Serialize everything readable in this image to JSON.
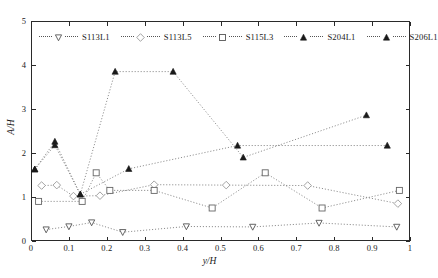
{
  "chart_data": {
    "type": "scatter",
    "title": "",
    "subtitle": "",
    "xlabel": "y/H",
    "ylabel": "A/H",
    "xlim": [
      0,
      1
    ],
    "ylim": [
      0,
      5
    ],
    "xticks": [
      "0",
      "0.1",
      "0.2",
      "0.3",
      "0.4",
      "0.5",
      "0.6",
      "0.7",
      "0.8",
      "0.9",
      "1"
    ],
    "xtick_values": [
      0,
      0.1,
      0.2,
      0.3,
      0.4,
      0.5,
      0.6,
      0.7,
      0.8,
      0.9,
      1
    ],
    "yticks": [
      "0",
      "1",
      "2",
      "3",
      "4",
      "5"
    ],
    "ytick_values": [
      0,
      1,
      2,
      3,
      4,
      5
    ],
    "grid": false,
    "legend_position": "top-inside",
    "line_style": "dotted",
    "series": [
      {
        "name": "S113L1",
        "marker": "triangle-down-open",
        "color": "#555555",
        "x": [
          0.04,
          0.1,
          0.16,
          0.242,
          0.41,
          0.585,
          0.76,
          0.965
        ],
        "y": [
          0.26,
          0.33,
          0.42,
          0.2,
          0.33,
          0.32,
          0.41,
          0.32
        ]
      },
      {
        "name": "S113L5",
        "marker": "diamond-open",
        "color": "#999999",
        "x": [
          0.028,
          0.068,
          0.112,
          0.182,
          0.325,
          0.515,
          0.73,
          0.968
        ],
        "y": [
          1.26,
          1.27,
          1.02,
          1.03,
          1.28,
          1.27,
          1.26,
          0.85
        ]
      },
      {
        "name": "S115L3",
        "marker": "square-open",
        "color": "#666666",
        "x": [
          0.02,
          0.135,
          0.172,
          0.208,
          0.325,
          0.478,
          0.618,
          0.768,
          0.972
        ],
        "y": [
          0.9,
          0.9,
          1.55,
          1.15,
          1.15,
          0.75,
          1.55,
          0.75,
          1.15
        ]
      },
      {
        "name": "S204L1",
        "marker": "triangle-up-filled",
        "color": "#1a1a1a",
        "x": [
          0.01,
          0.063,
          0.13,
          0.258,
          0.545,
          0.94
        ],
        "y": [
          1.63,
          2.26,
          1.06,
          1.64,
          2.17,
          2.17
        ]
      },
      {
        "name": "S206L1",
        "marker": "triangle-up-filled",
        "color": "#1a1a1a",
        "x": [
          0.01,
          0.063,
          0.13,
          0.222,
          0.375,
          0.56,
          0.885
        ],
        "y": [
          1.63,
          2.18,
          1.06,
          3.85,
          3.85,
          1.9,
          2.86
        ]
      }
    ]
  },
  "legend": {
    "items": [
      {
        "label": "S113L1",
        "marker": "triangle-down-open"
      },
      {
        "label": "S113L5",
        "marker": "diamond-open"
      },
      {
        "label": "S115L3",
        "marker": "square-open"
      },
      {
        "label": "S204L1",
        "marker": "triangle-up-filled"
      },
      {
        "label": "S206L1",
        "marker": "triangle-up-filled"
      }
    ]
  },
  "axes": {
    "x_title": "y/H",
    "y_title": "A/H",
    "x_tick_labels": [
      "0",
      "0.1",
      "0.2",
      "0.3",
      "0.4",
      "0.5",
      "0.6",
      "0.7",
      "0.8",
      "0.9",
      "1"
    ],
    "y_tick_labels": [
      "0",
      "1",
      "2",
      "3",
      "4",
      "5"
    ]
  },
  "colors": {
    "axis": "#2a2a2a",
    "line": "#777777",
    "marker_open": "#555555",
    "marker_filled": "#1a1a1a",
    "background": "#ffffff"
  }
}
